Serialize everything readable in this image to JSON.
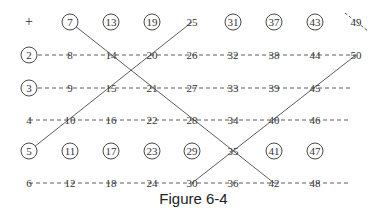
{
  "figure": {
    "caption": "Figure 6-4",
    "type": "sieve-grid",
    "columns": 8,
    "rows": 6,
    "first_cell_symbol": "+",
    "numbers": [
      [
        1,
        7,
        13,
        19,
        25,
        31,
        37,
        43,
        49
      ],
      [
        2,
        8,
        14,
        20,
        26,
        32,
        38,
        44,
        50
      ],
      [
        3,
        9,
        15,
        21,
        27,
        33,
        39,
        45
      ],
      [
        4,
        10,
        16,
        22,
        28,
        34,
        40,
        46
      ],
      [
        5,
        11,
        17,
        23,
        29,
        35,
        41,
        47
      ],
      [
        6,
        12,
        18,
        24,
        30,
        36,
        42,
        48
      ]
    ],
    "circled": [
      2,
      3,
      5,
      7,
      11,
      13,
      17,
      19,
      23,
      29,
      31,
      37,
      41,
      43,
      47
    ],
    "dashed_rows": [
      2,
      3,
      4,
      6
    ],
    "diagonal_lines": [
      [
        7,
        14,
        21,
        28,
        35,
        42
      ],
      [
        5,
        10,
        15,
        20,
        25
      ],
      [
        30,
        35,
        40,
        45,
        50
      ]
    ],
    "struck_marks": [
      49
    ],
    "colors": {
      "ink": "#333333",
      "background": "#ffffff"
    }
  }
}
